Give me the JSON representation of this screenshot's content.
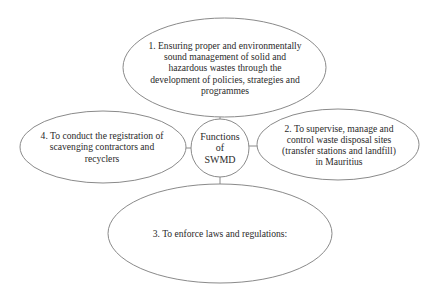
{
  "diagram": {
    "title": "Functions of SWMD",
    "center": {
      "lines": [
        "Functions",
        "of",
        "SWMD"
      ]
    },
    "nodes": [
      {
        "id": 1,
        "position": "top",
        "text": "1. Ensuring proper and environmentally sound management of solid and hazardous wastes through the development of policies, strategies and programmes"
      },
      {
        "id": 2,
        "position": "right",
        "text": "2. To supervise, manage and control waste disposal sites (transfer stations and landfill) in Mauritius"
      },
      {
        "id": 3,
        "position": "bottom",
        "text": "3. To enforce laws and regulations:"
      },
      {
        "id": 4,
        "position": "left",
        "text": "4. To conduct the registration of scavenging contractors and recyclers"
      }
    ],
    "colors": {
      "stroke": "#8a8a8a",
      "fill": "#ffffff",
      "text": "#2a2a2a"
    }
  }
}
